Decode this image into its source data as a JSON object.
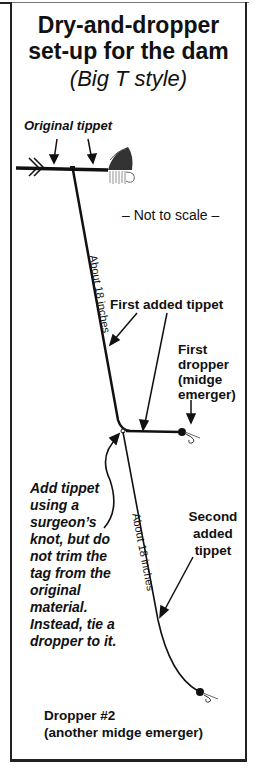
{
  "title": {
    "line1": "Dry-and-dropper",
    "line2": "set-up for the dam",
    "subtitle": "(Big T style)"
  },
  "labels": {
    "original_tippet": "Original tippet",
    "not_to_scale": "– Not to scale –",
    "length_1": "About 18 inches",
    "first_added_tippet": "First added tippet",
    "first_dropper": [
      "First",
      "dropper",
      "(midge",
      "emerger)"
    ],
    "knot_note": [
      "Add tippet",
      "using a",
      "surgeon’s",
      "knot, but do",
      "not trim the",
      "tag from the",
      "original",
      "material.",
      "Instead, tie a",
      "dropper to it."
    ],
    "length_2": "About 18 inches",
    "second_added_tippet": [
      "Second",
      "added",
      "tippet"
    ],
    "dropper_2": [
      "Dropper #2",
      "(another midge emerger)"
    ]
  },
  "icons": {
    "dry_fly": "dry-fly-icon",
    "midge_emerger_1": "midge-emerger-icon",
    "midge_emerger_2": "midge-emerger-icon",
    "line_break": "line-break-icon"
  },
  "colors": {
    "line": "#111111",
    "border": "#222222",
    "background": "#ffffff"
  }
}
